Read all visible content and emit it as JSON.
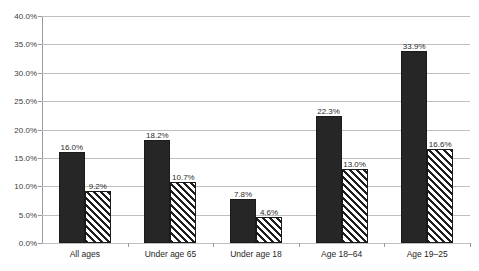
{
  "chart_data": {
    "type": "bar",
    "title": "",
    "xlabel": "",
    "ylabel": "",
    "ylim": [
      0,
      40
    ],
    "ytick_step": 5,
    "grid": true,
    "legend": "none",
    "categories": [
      "All ages",
      "Under age 65",
      "Under age 18",
      "Age 18–64",
      "Age 19–25"
    ],
    "ytick_labels": [
      "0.0%",
      "5.0%",
      "10.0%",
      "15.0%",
      "20.0%",
      "25.0%",
      "30.0%",
      "35.0%",
      "40.0%"
    ],
    "ytick_values": [
      0,
      5,
      10,
      15,
      20,
      25,
      30,
      35,
      40
    ],
    "series": [
      {
        "name": "series-1",
        "style": "solid",
        "color": "#262626",
        "values": [
          16.0,
          18.2,
          7.8,
          22.3,
          33.9
        ],
        "labels": [
          "16.0%",
          "18.2%",
          "7.8%",
          "22.3%",
          "33.9%"
        ]
      },
      {
        "name": "series-2",
        "style": "hatched",
        "color": "#ffffff",
        "values": [
          9.2,
          10.7,
          4.6,
          13.0,
          16.6
        ],
        "labels": [
          "9.2%",
          "10.7%",
          "4.6%",
          "13.0%",
          "16.6%"
        ]
      }
    ]
  },
  "colors": {
    "gridline": "#bfbfbf",
    "axis": "#9a9a9a",
    "bar_solid": "#262626",
    "bar_hatch_ink": "#1f1f1f",
    "bar_hatch_bg": "#ffffff",
    "label_text": "#2b2b2b",
    "tick_text": "#3c3c3c",
    "background": "#ffffff"
  }
}
